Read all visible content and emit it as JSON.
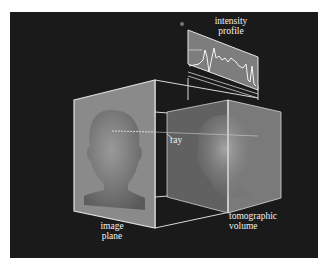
{
  "diagram": {
    "background_color": "#1a1a1a",
    "labels": {
      "intensity_profile": [
        "intensity",
        "profile"
      ],
      "ray": "ray",
      "image_plane": [
        "image",
        "plane"
      ],
      "tomographic_volume": [
        "tomographic",
        "volume"
      ]
    },
    "elements": [
      {
        "name": "image-plane",
        "description": "rendered gray head silhouette on a slanted plane"
      },
      {
        "name": "tomographic-volume",
        "description": "translucent box containing a semi-transparent head volume"
      },
      {
        "name": "ray",
        "description": "dotted line passing from image plane through the volume"
      },
      {
        "name": "intensity-profile",
        "description": "plot panel showing intensity along the ray"
      }
    ],
    "colors": {
      "frame_line": "#e0e0e0",
      "plane_fill": "#8a8a8a",
      "profile_fill": "#7d7d7d",
      "profile_line": "#f5f5f5"
    }
  }
}
